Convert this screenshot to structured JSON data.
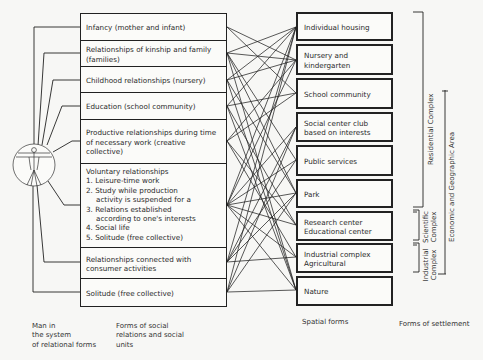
{
  "left_column": {
    "caption": "Forms of social\nrelations and social\nunits",
    "boxes": [
      {
        "label": "Infancy (mother and infant)"
      },
      {
        "label": "Relationships of kinship and family (families)"
      },
      {
        "label": "Childhood relationships (nursery)"
      },
      {
        "label": "Education (school community)"
      },
      {
        "label": "Productive relationships during time of necessary work (creative collective)"
      },
      {
        "title": "Voluntary relationships",
        "items": [
          "1. Leisure-time work",
          "2. Study while production",
          "activity is suspended for a",
          "3. Relations established",
          "according to one's interests",
          "4. Social life",
          "5. Solitude (free collective)"
        ]
      },
      {
        "label": "Relationships connected with consumer activities"
      },
      {
        "label": "Solitude (free collective)"
      }
    ]
  },
  "figure": {
    "icon": "vitruvian-man-icon",
    "caption": "Man in\nthe system\nof relational forms"
  },
  "right_column": {
    "caption": "Spatial forms",
    "boxes": [
      {
        "label": "Individual housing"
      },
      {
        "label": "Nursery and kindergarten"
      },
      {
        "label": "School community"
      },
      {
        "label": "Social center club based on interests"
      },
      {
        "label": "Public services"
      },
      {
        "label": "Park"
      },
      {
        "label": "Research center Educational center"
      },
      {
        "label": "Industrial complex Agricultural"
      },
      {
        "label": "Nature"
      }
    ]
  },
  "settlement": {
    "caption": "Forms of settlement",
    "brackets": [
      {
        "label": "Residential Complex"
      },
      {
        "label": "Scientific Complex"
      },
      {
        "label": "Industrial Complex"
      },
      {
        "label": "Economic and Geographic Area"
      }
    ]
  },
  "colors": {
    "line": "#222222",
    "background": "#f7f7f5"
  }
}
